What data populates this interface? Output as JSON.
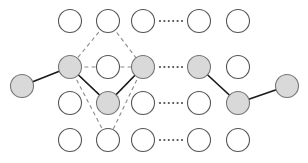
{
  "figure": {
    "canvas": {
      "width": 308,
      "height": 163,
      "background": "#ffffff"
    },
    "palette": {
      "node_open_fill": "#ffffff",
      "node_open_stroke": "#555555",
      "node_shaded_fill": "#d9d9d9",
      "node_shaded_stroke": "#777777",
      "edge_solid_color": "#1a1a1a",
      "edge_dashed_color": "#8c8c8c",
      "ellipsis_color": "#4d4d4d"
    },
    "node_radius": 11.5,
    "grid": {
      "column_x": [
        70,
        108,
        143,
        199,
        238
      ],
      "row_y": [
        21,
        67,
        103,
        140
      ],
      "edge_node_x": [
        22,
        287
      ]
    }
  },
  "nodes": [
    {
      "id": "r1c1",
      "row": 1,
      "col": 1,
      "cx": 70,
      "cy": 21,
      "r": 11.5,
      "state": "open"
    },
    {
      "id": "r1c2",
      "row": 1,
      "col": 2,
      "cx": 108,
      "cy": 21,
      "r": 11.5,
      "state": "open"
    },
    {
      "id": "r1c3",
      "row": 1,
      "col": 3,
      "cx": 143,
      "cy": 21,
      "r": 11.5,
      "state": "open"
    },
    {
      "id": "r1c4",
      "row": 1,
      "col": 4,
      "cx": 199,
      "cy": 21,
      "r": 11.5,
      "state": "open"
    },
    {
      "id": "r1c5",
      "row": 1,
      "col": 5,
      "cx": 238,
      "cy": 21,
      "r": 11.5,
      "state": "open"
    },
    {
      "id": "r2c0",
      "row": 2,
      "col": 0,
      "cx": 22,
      "cy": 86,
      "r": 11.5,
      "state": "shaded"
    },
    {
      "id": "r2c1",
      "row": 2,
      "col": 1,
      "cx": 70,
      "cy": 67,
      "r": 11.5,
      "state": "shaded"
    },
    {
      "id": "r2c2",
      "row": 2,
      "col": 2,
      "cx": 108,
      "cy": 67,
      "r": 11.5,
      "state": "open"
    },
    {
      "id": "r2c3",
      "row": 2,
      "col": 3,
      "cx": 143,
      "cy": 67,
      "r": 11.5,
      "state": "shaded"
    },
    {
      "id": "r2c4",
      "row": 2,
      "col": 4,
      "cx": 199,
      "cy": 67,
      "r": 11.5,
      "state": "shaded"
    },
    {
      "id": "r2c5",
      "row": 2,
      "col": 5,
      "cx": 238,
      "cy": 67,
      "r": 11.5,
      "state": "open"
    },
    {
      "id": "r3c1",
      "row": 3,
      "col": 1,
      "cx": 70,
      "cy": 103,
      "r": 11.5,
      "state": "open"
    },
    {
      "id": "r3c2",
      "row": 3,
      "col": 2,
      "cx": 108,
      "cy": 103,
      "r": 11.5,
      "state": "shaded"
    },
    {
      "id": "r3c3",
      "row": 3,
      "col": 3,
      "cx": 143,
      "cy": 103,
      "r": 11.5,
      "state": "open"
    },
    {
      "id": "r3c4",
      "row": 3,
      "col": 4,
      "cx": 199,
      "cy": 103,
      "r": 11.5,
      "state": "open"
    },
    {
      "id": "r3c5",
      "row": 3,
      "col": 5,
      "cx": 238,
      "cy": 103,
      "r": 11.5,
      "state": "shaded"
    },
    {
      "id": "r3c6",
      "row": 3,
      "col": 6,
      "cx": 287,
      "cy": 86,
      "r": 11.5,
      "state": "shaded"
    },
    {
      "id": "r4c1",
      "row": 4,
      "col": 1,
      "cx": 70,
      "cy": 140,
      "r": 11.5,
      "state": "open"
    },
    {
      "id": "r4c2",
      "row": 4,
      "col": 2,
      "cx": 108,
      "cy": 140,
      "r": 11.5,
      "state": "open"
    },
    {
      "id": "r4c3",
      "row": 4,
      "col": 3,
      "cx": 143,
      "cy": 140,
      "r": 11.5,
      "state": "open"
    },
    {
      "id": "r4c4",
      "row": 4,
      "col": 4,
      "cx": 199,
      "cy": 140,
      "r": 11.5,
      "state": "open"
    },
    {
      "id": "r4c5",
      "row": 4,
      "col": 5,
      "cx": 238,
      "cy": 140,
      "r": 11.5,
      "state": "open"
    }
  ],
  "solid_edges": [
    {
      "id": "e1",
      "from": "r2c0",
      "to": "r2c1",
      "x1": 22,
      "y1": 86,
      "x2": 70,
      "y2": 67
    },
    {
      "id": "e2",
      "from": "r2c1",
      "to": "r3c2",
      "x1": 70,
      "y1": 67,
      "x2": 108,
      "y2": 103
    },
    {
      "id": "e3",
      "from": "r3c2",
      "to": "r2c3",
      "x1": 108,
      "y1": 103,
      "x2": 143,
      "y2": 67
    },
    {
      "id": "e4",
      "from": "r2c4",
      "to": "r3c5",
      "x1": 199,
      "y1": 67,
      "x2": 238,
      "y2": 103
    },
    {
      "id": "e5",
      "from": "r3c5",
      "to": "r3c6",
      "x1": 238,
      "y1": 103,
      "x2": 287,
      "y2": 86
    }
  ],
  "dashed_edges": [
    {
      "id": "d1",
      "from": "r1c2",
      "to": "r2c1",
      "x1": 108,
      "y1": 21,
      "x2": 70,
      "y2": 67
    },
    {
      "id": "d2",
      "from": "r1c2",
      "to": "r2c3",
      "x1": 108,
      "y1": 21,
      "x2": 143,
      "y2": 67
    },
    {
      "id": "d3",
      "from": "r2c1",
      "to": "r2c3",
      "x1": 70,
      "y1": 67,
      "x2": 143,
      "y2": 67
    },
    {
      "id": "d4",
      "from": "r2c1",
      "to": "r3c2",
      "x1": 70,
      "y1": 67,
      "x2": 108,
      "y2": 103
    },
    {
      "id": "d5",
      "from": "r2c3",
      "to": "r3c2",
      "x1": 143,
      "y1": 67,
      "x2": 108,
      "y2": 103
    },
    {
      "id": "d6",
      "from": "r2c1",
      "to": "r4c2",
      "x1": 70,
      "y1": 67,
      "x2": 108,
      "y2": 140
    },
    {
      "id": "d7",
      "from": "r2c3",
      "to": "r4c2",
      "x1": 143,
      "y1": 67,
      "x2": 108,
      "y2": 140
    }
  ],
  "ellipses": [
    {
      "id": "el1",
      "row": 1,
      "y": 21,
      "x_start": 160,
      "x_end": 182,
      "dots": 6,
      "radius": 1.1
    },
    {
      "id": "el2",
      "row": 2,
      "y": 67,
      "x_start": 160,
      "x_end": 182,
      "dots": 6,
      "radius": 1.1
    },
    {
      "id": "el3",
      "row": 3,
      "y": 103,
      "x_start": 160,
      "x_end": 182,
      "dots": 6,
      "radius": 1.1
    },
    {
      "id": "el4",
      "row": 4,
      "y": 140,
      "x_start": 160,
      "x_end": 182,
      "dots": 6,
      "radius": 1.1
    }
  ]
}
